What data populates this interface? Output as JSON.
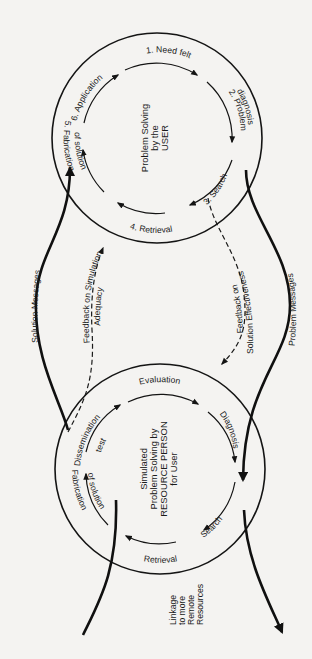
{
  "figure": {
    "type": "two-cycle problem solving diagram",
    "rotation_deg": 90,
    "colors": {
      "background": "#f4f3f1",
      "ink": "#141414"
    }
  },
  "user_cycle": {
    "title_lines": [
      "Problem Solving",
      "by the",
      "USER"
    ],
    "steps": [
      {
        "label": "1. Need felt"
      },
      {
        "label": "2. Problem",
        "label2": "diagnosis"
      },
      {
        "label": "3. Search"
      },
      {
        "label": "4. Retrieval"
      },
      {
        "label": "5. Fabrication",
        "label2": "of solution"
      },
      {
        "label": "6. Application"
      }
    ]
  },
  "resource_cycle": {
    "title_lines": [
      "Simulated",
      "Problem Solving by",
      "RESOURCE PERSON",
      "for User"
    ],
    "steps": [
      {
        "label": "Evaluation"
      },
      {
        "label": "Diagnosis"
      },
      {
        "label": "Search"
      },
      {
        "label": "Retrieval"
      },
      {
        "label": "Fabrication",
        "label2": "of solution"
      },
      {
        "label": "Dissemination",
        "label2": "test"
      }
    ]
  },
  "connectors": {
    "solution_messages": "Solution Messages",
    "problem_messages": "Problem Messages",
    "feedback_simulation": [
      "Feedback on Simulation",
      "Adequacy"
    ],
    "feedback_effectiveness": [
      "Feedback on",
      "Solution Effectiveness"
    ],
    "linkage": [
      "Linkage",
      "to more",
      "Remote",
      "Resources"
    ]
  }
}
